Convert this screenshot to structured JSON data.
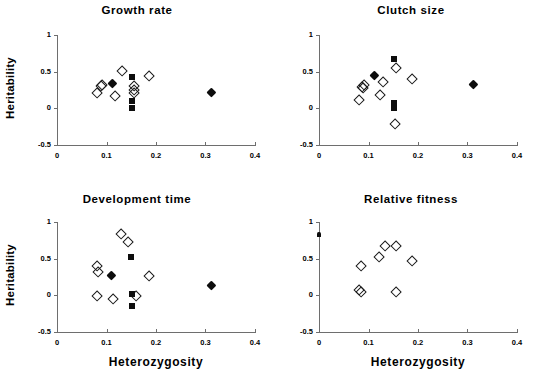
{
  "figure": {
    "width": 548,
    "height": 378,
    "background": "#ffffff",
    "ink": "#000000",
    "axis_color": "#6e6e6e"
  },
  "axes": {
    "xlabel": "Heterozygosity",
    "ylabel": "Heritability",
    "xlim": [
      0,
      0.4
    ],
    "ylim": [
      -0.5,
      1
    ],
    "xticks": [
      0,
      0.1,
      0.2,
      0.3,
      0.4
    ],
    "xticklabels": [
      "0",
      "0.1",
      "0.2",
      "0.3",
      "0.4"
    ],
    "yticks": [
      -0.5,
      0,
      0.5,
      1
    ],
    "yticklabels": [
      "-0.5",
      "0",
      "0.5",
      "1"
    ],
    "grid": false,
    "legend": "none"
  },
  "chart_data": [
    {
      "type": "scatter",
      "title": "Growth rate",
      "xlabel": "Heterozygosity",
      "ylabel": "Heritability",
      "xlim": [
        0,
        0.4
      ],
      "ylim": [
        -0.5,
        1
      ],
      "xticks": [
        0,
        0.1,
        0.2,
        0.3,
        0.4
      ],
      "yticks": [
        -0.5,
        0,
        0.5,
        1
      ],
      "grid": false,
      "series": [
        {
          "name": "open-diamond",
          "marker": "open-diamond",
          "points": [
            [
              0.079,
              0.22
            ],
            [
              0.088,
              0.31
            ],
            [
              0.09,
              0.32
            ],
            [
              0.116,
              0.17
            ],
            [
              0.131,
              0.51
            ],
            [
              0.155,
              0.31
            ],
            [
              0.154,
              0.25
            ],
            [
              0.154,
              0.22
            ],
            [
              0.185,
              0.45
            ]
          ]
        },
        {
          "name": "filled-square",
          "marker": "filled-square",
          "points": [
            [
              0.151,
              0.43
            ],
            [
              0.151,
              0.1
            ],
            [
              0.151,
              0.01
            ]
          ]
        },
        {
          "name": "filled-diamond",
          "marker": "filled-diamond",
          "points": [
            [
              0.111,
              0.34
            ],
            [
              0.311,
              0.22
            ]
          ]
        }
      ]
    },
    {
      "type": "scatter",
      "title": "Clutch size",
      "xlabel": "Heterozygosity",
      "ylabel": "Heritability",
      "xlim": [
        0,
        0.4
      ],
      "ylim": [
        -0.5,
        1
      ],
      "xticks": [
        0,
        0.1,
        0.2,
        0.3,
        0.4
      ],
      "yticks": [
        -0.5,
        0,
        0.5,
        1
      ],
      "grid": false,
      "series": [
        {
          "name": "open-diamond",
          "marker": "open-diamond",
          "points": [
            [
              0.08,
              0.12
            ],
            [
              0.086,
              0.3
            ],
            [
              0.09,
              0.33
            ],
            [
              0.089,
              0.28
            ],
            [
              0.122,
              0.19
            ],
            [
              0.128,
              0.36
            ],
            [
              0.154,
              0.56
            ],
            [
              0.153,
              -0.21
            ],
            [
              0.188,
              0.41
            ]
          ]
        },
        {
          "name": "filled-square",
          "marker": "filled-square",
          "points": [
            [
              0.152,
              0.67
            ],
            [
              0.152,
              0.08
            ],
            [
              0.152,
              0.01
            ]
          ]
        },
        {
          "name": "filled-diamond",
          "marker": "filled-diamond",
          "points": [
            [
              0.111,
              0.45
            ],
            [
              0.311,
              0.32
            ]
          ]
        }
      ]
    },
    {
      "type": "scatter",
      "title": "Development time",
      "xlabel": "Heterozygosity",
      "ylabel": "Heritability",
      "xlim": [
        0,
        0.4
      ],
      "ylim": [
        -0.5,
        1
      ],
      "xticks": [
        0,
        0.1,
        0.2,
        0.3,
        0.4
      ],
      "yticks": [
        -0.5,
        0,
        0.5,
        1
      ],
      "grid": false,
      "series": [
        {
          "name": "open-diamond",
          "marker": "open-diamond",
          "points": [
            [
              0.08,
              0.41
            ],
            [
              0.082,
              0.32
            ],
            [
              0.08,
              -0.01
            ],
            [
              0.113,
              -0.04
            ],
            [
              0.128,
              0.84
            ],
            [
              0.143,
              0.73
            ],
            [
              0.159,
              -0.01
            ],
            [
              0.185,
              0.27
            ]
          ]
        },
        {
          "name": "filled-square",
          "marker": "filled-square",
          "points": [
            [
              0.15,
              0.52
            ],
            [
              0.151,
              0.02
            ],
            [
              0.151,
              -0.15
            ]
          ]
        },
        {
          "name": "filled-diamond",
          "marker": "filled-diamond",
          "points": [
            [
              0.11,
              0.27
            ],
            [
              0.311,
              0.13
            ]
          ]
        }
      ]
    },
    {
      "type": "scatter",
      "title": "Relative fitness",
      "xlabel": "Heterozygosity",
      "ylabel": "Heritability",
      "xlim": [
        0,
        0.4
      ],
      "ylim": [
        -0.5,
        1
      ],
      "xticks": [
        0,
        0.1,
        0.2,
        0.3,
        0.4
      ],
      "yticks": [
        -0.5,
        0,
        0.5,
        1
      ],
      "grid": false,
      "series": [
        {
          "name": "open-diamond",
          "marker": "open-diamond",
          "points": [
            [
              0.079,
              0.08
            ],
            [
              0.085,
              0.05
            ],
            [
              0.085,
              0.4
            ],
            [
              0.12,
              0.53
            ],
            [
              0.132,
              0.68
            ],
            [
              0.155,
              0.68
            ],
            [
              0.155,
              0.05
            ],
            [
              0.188,
              0.47
            ]
          ]
        },
        {
          "name": "filled-marker",
          "marker": "small-filled",
          "points": [
            [
              0.001,
              0.83
            ]
          ]
        }
      ]
    }
  ]
}
